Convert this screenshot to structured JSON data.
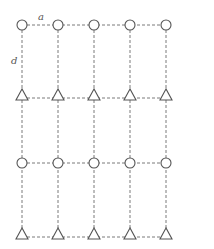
{
  "diagram": {
    "title": "",
    "labels": {
      "horizontal_spacing": "a",
      "vertical_spacing": "d"
    },
    "columns_x": [
      22,
      58,
      94,
      130,
      166
    ],
    "rows": [
      {
        "y": 25,
        "node_type": "circle"
      },
      {
        "y": 95,
        "node_type": "triangle"
      },
      {
        "y": 163,
        "node_type": "circle"
      },
      {
        "y": 234,
        "node_type": "triangle"
      }
    ],
    "colors": {
      "stroke": "#555555",
      "dashed_line": "#7a7a7a",
      "background": "#ffffff"
    },
    "grid": {
      "columns": 5,
      "rows": 4,
      "line_style": "dashed"
    }
  }
}
